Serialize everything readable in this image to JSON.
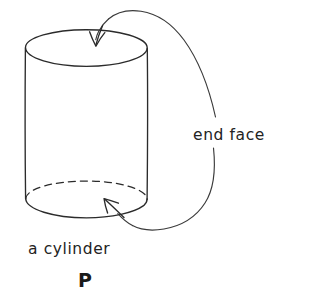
{
  "figure": {
    "name": "hand-drawn-cylinder-diagram",
    "background_color": "#ffffff",
    "ink_color": "#2b2b2b",
    "width": 314,
    "height": 300,
    "labels": {
      "end_face": "end face",
      "a_cylinder": "a cylinder",
      "panel_letter": "P"
    },
    "annotations": [
      {
        "id": "end-face-top",
        "label": "end face",
        "target": "top circular face of the cylinder",
        "arrow": "curved leader from label sweeping up and left, arrowhead pointing down into the top ellipse"
      },
      {
        "id": "end-face-bottom",
        "label": "end face",
        "target": "bottom circular face of the cylinder",
        "arrow": "curved leader from label sweeping down and left, arrowhead pointing up-left into the bottom ellipse"
      }
    ],
    "shape": {
      "kind": "cylinder",
      "top_ellipse": {
        "cx": 86,
        "cy": 48,
        "rx": 61,
        "ry": 18
      },
      "bottom_ellipse": {
        "cx": 86,
        "cy": 199,
        "rx": 61,
        "ry": 18
      },
      "hidden_edge_style": "dashed",
      "visible_edge_style": "solid"
    }
  }
}
